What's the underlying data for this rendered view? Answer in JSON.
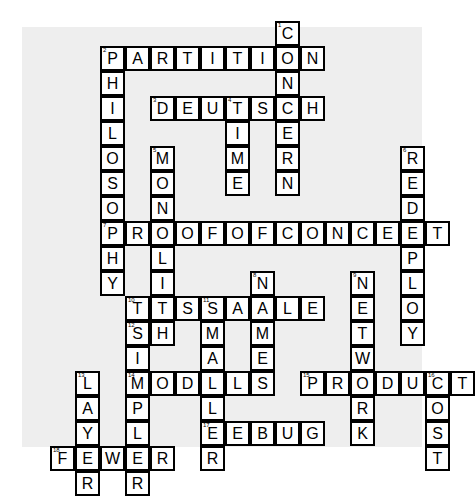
{
  "puzzle": {
    "kind": "crossword",
    "title": "",
    "paper_color": "#eeeeee",
    "page_color": "#ffffff",
    "cell_fill": "#ffffff",
    "cell_border": "#000000",
    "letter_color": "#000000",
    "cell_size_px": 25,
    "origin": {
      "x": 100,
      "y": 21
    },
    "columns": 16,
    "rows": 19
  },
  "entries": {
    "across": [
      {
        "number": "2",
        "answer": "PARTITION",
        "row": 1,
        "col": 0
      },
      {
        "number": "3",
        "answer": "DEUTSCH",
        "row": 3,
        "col": 2
      },
      {
        "number": "7",
        "answer": "PROOFOFCONCEPT",
        "row": 8,
        "col": 0
      },
      {
        "number": "10",
        "answer": "TESTABLE",
        "row": 11,
        "col": 1
      },
      {
        "number": "14",
        "answer": "MODELS",
        "row": 14,
        "col": 1
      },
      {
        "number": "15",
        "answer": "PRODUCT",
        "row": 14,
        "col": 8
      },
      {
        "number": "17",
        "answer": "DEBUG",
        "row": 16,
        "col": 4
      },
      {
        "number": "18",
        "answer": "FEWER",
        "row": 17,
        "col": -2
      }
    ],
    "down": [
      {
        "number": "1",
        "answer": "CONCERN",
        "row": 0,
        "col": 7
      },
      {
        "number": "2",
        "answer": "PHILOSOPHY",
        "row": 1,
        "col": 0
      },
      {
        "number": "4",
        "answer": "TIME",
        "row": 3,
        "col": 5
      },
      {
        "number": "5",
        "answer": "MONOLITH",
        "row": 5,
        "col": 2
      },
      {
        "number": "6",
        "answer": "REDEPLOY",
        "row": 5,
        "col": 12
      },
      {
        "number": "8",
        "answer": "NAME",
        "row": 10,
        "col": 6
      },
      {
        "number": "9",
        "answer": "NETWORK",
        "row": 10,
        "col": 10
      },
      {
        "number": "11",
        "answer": "SMALLER",
        "row": 11,
        "col": 4
      },
      {
        "number": "12",
        "answer": "SIMPLER",
        "row": 12,
        "col": 1
      },
      {
        "number": "13",
        "answer": "LAYER",
        "row": 14,
        "col": -1
      },
      {
        "number": "16",
        "answer": "COST",
        "row": 14,
        "col": 13
      }
    ]
  }
}
